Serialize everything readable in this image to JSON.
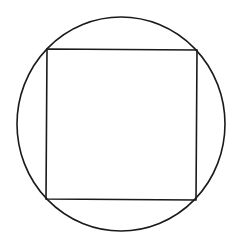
{
  "diagram": {
    "colors": {
      "background": "#ffffff",
      "stroke": "#1a1a1a"
    },
    "circle": {
      "cx": 121,
      "cy": 124,
      "rx": 104,
      "ry": 107,
      "stroke_width": 1.6
    },
    "square": {
      "points": [
        [
          47,
          49
        ],
        [
          197,
          50
        ],
        [
          196,
          200
        ],
        [
          46,
          199
        ]
      ],
      "stroke_width": 1.6
    }
  }
}
